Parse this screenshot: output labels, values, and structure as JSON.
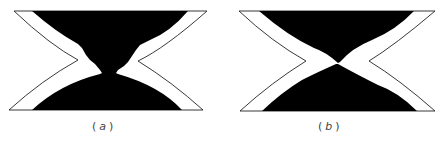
{
  "figure": {
    "panels": [
      {
        "id": "a",
        "label": "a",
        "caption_open": "(",
        "caption_close": ")",
        "description": "Hourglass-shaped cross-section with black upper and lower regions joined by a narrow neck at the center"
      },
      {
        "id": "b",
        "label": "b",
        "caption_open": "(",
        "caption_close": ")",
        "description": "Hourglass-shaped cross-section with black upper and lower regions meeting at a single point; white bands widen diagonally across the center"
      }
    ],
    "colors": {
      "fill": "#000000",
      "outline": "#222222",
      "background": "#ffffff"
    }
  }
}
